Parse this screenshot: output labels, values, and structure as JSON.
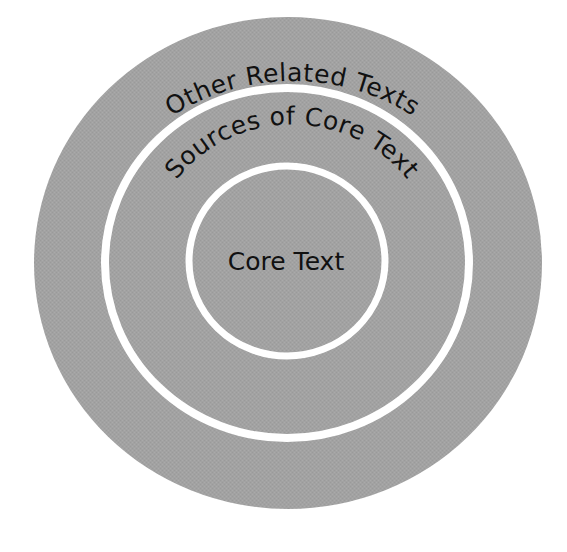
{
  "diagram": {
    "type": "concentric-circles",
    "background_color": "#ffffff",
    "fill_color": "#a2a2a2",
    "ring_color": "#ffffff",
    "text_color": "#111111",
    "layers": [
      {
        "level": "outer",
        "label": "Other Related Texts"
      },
      {
        "level": "middle",
        "label": "Sources of Core Text"
      },
      {
        "level": "center",
        "label": "Core Text"
      }
    ]
  }
}
